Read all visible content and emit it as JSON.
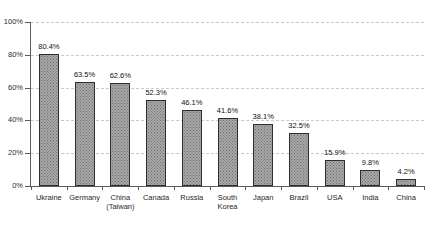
{
  "chart_data": {
    "type": "bar",
    "title": "",
    "subtitle": "",
    "xlabel": "",
    "ylabel": "",
    "ylim": [
      0,
      100
    ],
    "ytick_labels": [
      "0%",
      "20%",
      "40%",
      "60%",
      "80%",
      "100%"
    ],
    "ytick_values": [
      0,
      20,
      40,
      60,
      80,
      100
    ],
    "grid": true,
    "grid_style": "dashed-horizontal",
    "legend": false,
    "legend_position": "none",
    "value_label_suffix": "%",
    "categories": [
      "Ukraine",
      "Germany",
      "China\n(Taiwan)",
      "Canada",
      "Russia",
      "South\nKorea",
      "Japan",
      "Brazil",
      "USA",
      "India",
      "China"
    ],
    "values": [
      80.4,
      63.5,
      62.6,
      52.3,
      46.1,
      41.6,
      38.1,
      32.5,
      15.9,
      9.8,
      4.2
    ],
    "value_labels": [
      "80.4%",
      "63.5%",
      "62.6%",
      "52.3%",
      "46.1%",
      "41.6%",
      "38.1%",
      "32.5%",
      "15.9%",
      "9.8%",
      "4.2%"
    ],
    "colors": {
      "bar_fill": "#a8a8a8",
      "bar_pattern": "#6f6f6f",
      "bar_border": "#2e2e2e",
      "gridline": "#c9c9c9",
      "axis": "#5a5a5a",
      "text": "#1a1a1a",
      "background": "#ffffff"
    }
  }
}
